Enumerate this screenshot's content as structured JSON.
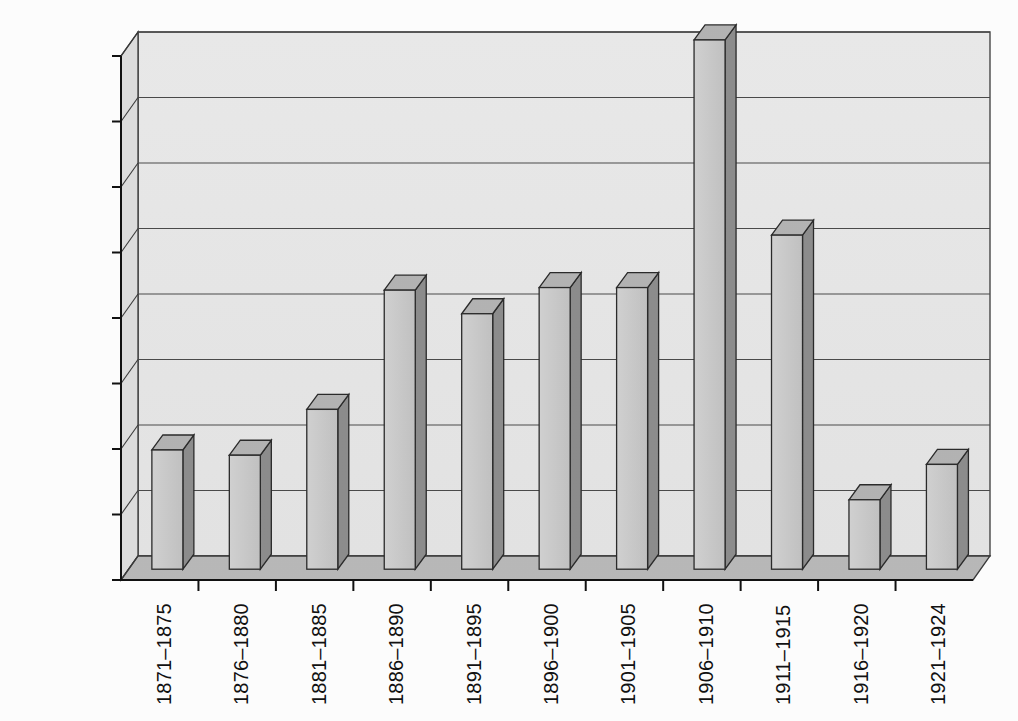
{
  "chart_data": {
    "type": "bar",
    "title": "",
    "subtitle": "",
    "xlabel": "",
    "ylabel": "",
    "categories": [
      "1871–1875",
      "1876–1880",
      "1881–1885",
      "1886–1890",
      "1891–1895",
      "1896–1900",
      "1901–1905",
      "1906–1910",
      "1911–1915",
      "1916–1920",
      "1921–1924"
    ],
    "values": [
      91000,
      87000,
      122000,
      213000,
      195000,
      215000,
      215000,
      404000,
      255000,
      53000,
      80000
    ],
    "ylim": [
      0,
      400000
    ],
    "ytick_values": [
      0,
      50000,
      100000,
      150000,
      200000,
      250000,
      300000,
      350000,
      400000
    ],
    "ytick_labels": [
      "0",
      "50,000",
      "100,000",
      "150,000",
      "200,000",
      "250,000",
      "300,000",
      "350,000",
      "400,000"
    ],
    "grid": true,
    "legend": false,
    "legend_position": "none",
    "style": "3d-column",
    "colors": {
      "bar_front": "#c9c9c9",
      "bar_side": "#8d8d8d",
      "bar_top": "#b4b4b4",
      "plot_background": "#e9e9e9",
      "floor": "#b9b9b9",
      "left_wall": "#dcdcdc",
      "gridline": "#4a4a4a",
      "axis": "#111111",
      "text": "#111111",
      "page_background": "#fefefe"
    }
  }
}
